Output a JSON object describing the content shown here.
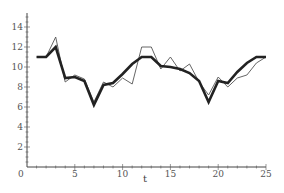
{
  "chart_data": {
    "type": "line",
    "title": "",
    "xlabel": "t",
    "ylabel": "",
    "xlim": [
      0,
      25
    ],
    "ylim": [
      0,
      15.4
    ],
    "x_ticks": [
      0,
      5,
      10,
      15,
      20,
      25
    ],
    "y_ticks": [
      2,
      4,
      6,
      8,
      10,
      12,
      14
    ],
    "origin_label": "0",
    "grid": false,
    "legend": null,
    "x": [
      1,
      2,
      3,
      4,
      5,
      6,
      7,
      8,
      9,
      10,
      11,
      12,
      13,
      14,
      15,
      16,
      17,
      18,
      19,
      20,
      21,
      22,
      23,
      24,
      25
    ],
    "series": [
      {
        "name": "thick",
        "style": "bold",
        "color": "#222222",
        "values": [
          11,
          11,
          12,
          8.9,
          9,
          8.6,
          6.2,
          8.2,
          8.4,
          9.3,
          10.3,
          11,
          11,
          10.1,
          10,
          9.8,
          9.4,
          8.6,
          6.5,
          8.6,
          8.4,
          9.5,
          10.4,
          11,
          11
        ]
      },
      {
        "name": "thin",
        "style": "thin",
        "color": "#555555",
        "values": [
          11,
          11,
          13,
          8.5,
          9.2,
          8.8,
          6.5,
          8.5,
          8.0,
          8.9,
          8.3,
          12,
          12,
          9.8,
          11,
          9.6,
          10.3,
          8.5,
          7.2,
          9,
          8,
          8.9,
          9.2,
          10.4,
          11
        ]
      }
    ]
  },
  "axes": {
    "x_label": "t",
    "origin": "0",
    "x_tick_labels": [
      "5",
      "10",
      "15",
      "20",
      "25"
    ],
    "y_tick_labels": [
      "2",
      "4",
      "6",
      "8",
      "10",
      "12",
      "14"
    ]
  }
}
